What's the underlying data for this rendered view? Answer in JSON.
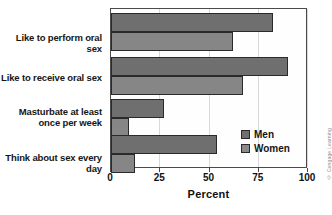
{
  "chart_data": {
    "type": "bar",
    "orientation": "horizontal",
    "title": "",
    "xlabel": "Percent",
    "ylabel": "",
    "xlim": [
      0,
      100
    ],
    "xticks": [
      0,
      25,
      50,
      75,
      100
    ],
    "grid": true,
    "legend_position": "inside-lower-right",
    "categories": [
      "Like to perform oral sex",
      "Like to receive oral sex",
      "Masturbate at least\nonce per week",
      "Think about sex every day"
    ],
    "series": [
      {
        "name": "Men",
        "color": "#6f6f6f",
        "values": [
          82,
          90,
          27,
          54
        ]
      },
      {
        "name": "Women",
        "color": "#868686",
        "values": [
          62,
          67,
          9,
          12
        ]
      }
    ]
  },
  "axis": {
    "x_title": "Percent",
    "tick_labels": [
      "0",
      "25",
      "50",
      "75",
      "100"
    ]
  },
  "legend": {
    "entries": [
      {
        "label": "Men"
      },
      {
        "label": "Women"
      }
    ]
  },
  "credit": {
    "text": "© Cengage Learning"
  },
  "colors": {
    "men": "#6f6f6f",
    "women": "#868686",
    "frame": "#4a4a4a",
    "grid": "#d8d8d8"
  }
}
